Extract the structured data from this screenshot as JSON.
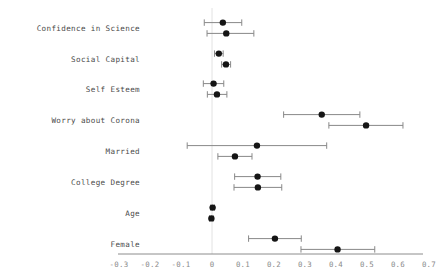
{
  "chart_data": {
    "type": "scatter",
    "title": "",
    "subtitle": "",
    "xlabel": "",
    "ylabel": "",
    "grid": false,
    "legend_position": "none",
    "orientation": "horizontal",
    "style": "forest-plot",
    "xlim": [
      -0.35,
      0.75
    ],
    "xticks": [
      -0.3,
      -0.2,
      -0.1,
      0,
      0.1,
      0.2,
      0.3,
      0.4,
      0.5,
      0.6,
      0.7
    ],
    "xticklabels": [
      "-0.3",
      "-0.2",
      "-0.1",
      "0",
      "0.1",
      "0.2",
      "0.3",
      "0.4",
      "0.5",
      "0.6",
      "0.7"
    ],
    "reference_line": 0,
    "categories": [
      "Confidence in Science",
      "Social Capital",
      "Self Esteem",
      "Worry about Corona",
      "Married",
      "College Degree",
      "Age",
      "Female"
    ],
    "series": [
      {
        "name": "Model 1",
        "estimates": [
          0.035,
          0.022,
          0.005,
          0.354,
          0.145,
          0.147,
          0.002,
          0.203
        ],
        "ci_low": [
          -0.025,
          0.008,
          -0.028,
          0.231,
          -0.08,
          0.073,
          -0.004,
          0.118
        ],
        "ci_high": [
          0.096,
          0.036,
          0.038,
          0.477,
          0.37,
          0.222,
          0.008,
          0.288
        ]
      },
      {
        "name": "Model 2",
        "estimates": [
          0.046,
          0.045,
          0.016,
          0.497,
          0.074,
          0.148,
          -0.002,
          0.405
        ],
        "ci_low": [
          -0.016,
          0.031,
          -0.015,
          0.377,
          0.019,
          0.071,
          -0.008,
          0.287
        ],
        "ci_high": [
          0.135,
          0.06,
          0.048,
          0.616,
          0.129,
          0.225,
          0.004,
          0.525
        ]
      }
    ],
    "points": [
      {
        "label": "Confidence in Science",
        "series": "Model 1",
        "estimate": 0.035,
        "ci_low": -0.025,
        "ci_high": 0.096
      },
      {
        "label": "Confidence in Science",
        "series": "Model 2",
        "estimate": 0.046,
        "ci_low": -0.016,
        "ci_high": 0.135
      },
      {
        "label": "Social Capital",
        "series": "Model 1",
        "estimate": 0.022,
        "ci_low": 0.008,
        "ci_high": 0.036
      },
      {
        "label": "Social Capital",
        "series": "Model 2",
        "estimate": 0.045,
        "ci_low": 0.031,
        "ci_high": 0.06
      },
      {
        "label": "Self Esteem",
        "series": "Model 1",
        "estimate": 0.005,
        "ci_low": -0.028,
        "ci_high": 0.038
      },
      {
        "label": "Self Esteem",
        "series": "Model 2",
        "estimate": 0.016,
        "ci_low": -0.015,
        "ci_high": 0.048
      },
      {
        "label": "Worry about Corona",
        "series": "Model 1",
        "estimate": 0.354,
        "ci_low": 0.231,
        "ci_high": 0.477
      },
      {
        "label": "Worry about Corona",
        "series": "Model 2",
        "estimate": 0.497,
        "ci_low": 0.377,
        "ci_high": 0.616
      },
      {
        "label": "Married",
        "series": "Model 1",
        "estimate": 0.145,
        "ci_low": -0.08,
        "ci_high": 0.37
      },
      {
        "label": "Married",
        "series": "Model 2",
        "estimate": 0.074,
        "ci_low": 0.019,
        "ci_high": 0.129
      },
      {
        "label": "College Degree",
        "series": "Model 1",
        "estimate": 0.147,
        "ci_low": 0.073,
        "ci_high": 0.222
      },
      {
        "label": "College Degree",
        "series": "Model 2",
        "estimate": 0.148,
        "ci_low": 0.071,
        "ci_high": 0.225
      },
      {
        "label": "Age",
        "series": "Model 1",
        "estimate": 0.002,
        "ci_low": -0.004,
        "ci_high": 0.008
      },
      {
        "label": "Age",
        "series": "Model 2",
        "estimate": -0.002,
        "ci_low": -0.008,
        "ci_high": 0.004
      },
      {
        "label": "Female",
        "series": "Model 1",
        "estimate": 0.203,
        "ci_low": 0.118,
        "ci_high": 0.288
      },
      {
        "label": "Female",
        "series": "Model 2",
        "estimate": 0.405,
        "ci_low": 0.287,
        "ci_high": 0.525
      }
    ],
    "colors": {
      "point": "#151515",
      "interval": "#888888",
      "axis": "#8c8c8c",
      "reference": "#e2e2e2",
      "label": "#4a4a4a",
      "tick": "#8a8a8a",
      "background": "#ffffff"
    }
  }
}
